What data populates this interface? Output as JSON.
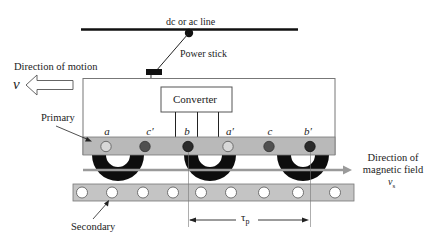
{
  "diagram": {
    "labels": {
      "supply_line": "dc or ac line",
      "power_stick": "Power stick",
      "direction_of_motion": "Direction of motion",
      "velocity_symbol": "v",
      "converter": "Converter",
      "primary": "Primary",
      "secondary": "Secondary",
      "field_direction_line1": "Direction of",
      "field_direction_line2": "magnetic field",
      "field_velocity_symbol": "v",
      "field_velocity_subscript": "s",
      "pole_pitch_symbol": "τ",
      "pole_pitch_subscript": "p"
    },
    "phase_labels": [
      "a",
      "c′",
      "b",
      "a′",
      "c",
      "b′"
    ],
    "phase_conductor_colors": [
      "#d6d6d6",
      "#505050",
      "#2a2a2a",
      "#d6d6d6",
      "#505050",
      "#2a2a2a"
    ],
    "colors": {
      "line": "#111111",
      "body_outline": "#777777",
      "primary_band": "#b9b9b9",
      "secondary_band": "#c4c4c4",
      "coil": "#0d0d0d",
      "field_arrow": "#9a9a9a",
      "text": "#222222"
    },
    "secondary_conductor_count": 9
  }
}
